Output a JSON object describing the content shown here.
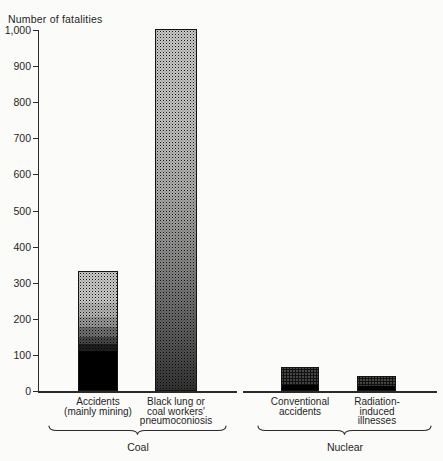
{
  "chart_data": {
    "type": "bar",
    "ylabel": "Number of fatalities",
    "ylim": [
      0,
      1000
    ],
    "grid": false,
    "legend": "none",
    "yticks": [
      {
        "value": 0,
        "label": "0"
      },
      {
        "value": 100,
        "label": "100"
      },
      {
        "value": 200,
        "label": "200"
      },
      {
        "value": 300,
        "label": "300"
      },
      {
        "value": 400,
        "label": "400"
      },
      {
        "value": 500,
        "label": "500"
      },
      {
        "value": 600,
        "label": "600"
      },
      {
        "value": 700,
        "label": "700"
      },
      {
        "value": 800,
        "label": "800"
      },
      {
        "value": 900,
        "label": "900"
      },
      {
        "value": 1000,
        "label": "1,000"
      }
    ],
    "groups": [
      {
        "label": "Coal",
        "bars": [
          {
            "id": "accidents",
            "label": "Accidents\n(mainly mining)",
            "value": 330,
            "shading": "stipple gradient, light at top grading to solid black below ~110"
          },
          {
            "id": "black-lung",
            "label": "Black lung or\ncoal workers'\npneumoconiosis",
            "value": 1000,
            "shading": "stipple gradient, light at top to dense dark stipple at bottom"
          }
        ]
      },
      {
        "label": "Nuclear",
        "bars": [
          {
            "id": "conventional",
            "label": "Conventional\naccidents",
            "value": 65,
            "shading": "medium stipple with solid black below ~15"
          },
          {
            "id": "radiation",
            "label": "Radiation-induced\nillnesses",
            "value": 40,
            "shading": "medium stipple with solid black below ~10"
          }
        ]
      }
    ],
    "colors": {
      "ink": "#1f1f1f",
      "background": "#fbfbf9",
      "bar_fill_base": "#fdfdfc"
    }
  }
}
